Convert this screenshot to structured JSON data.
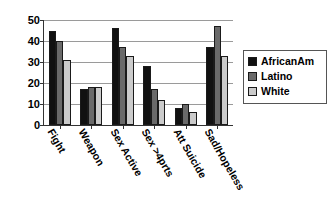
{
  "chart_data": {
    "type": "bar",
    "title": "",
    "subtitle": "",
    "xlabel": "",
    "ylabel": "",
    "ylim": [
      0,
      50
    ],
    "ytick_step": 10,
    "ytick_labels": [
      "50",
      "40",
      "30",
      "20",
      "10",
      "0"
    ],
    "ytick_values": [
      50,
      40,
      30,
      20,
      10,
      0
    ],
    "grid": true,
    "grid_axis": "y",
    "legend_position": "right",
    "categories": [
      "Fight",
      "Weapon",
      "Sex Active",
      "Sex >4prts",
      "Att Suicide",
      "Sad/Hopeless"
    ],
    "series": [
      {
        "name": "AfricanAm",
        "color": "#111111",
        "values": [
          45,
          17,
          46,
          28,
          8,
          37
        ]
      },
      {
        "name": "Latino",
        "color": "#6a6a6a",
        "values": [
          40,
          18,
          37,
          17,
          10,
          47
        ]
      },
      {
        "name": "White",
        "color": "#cbcbcb",
        "values": [
          31,
          18,
          33,
          12,
          6,
          33
        ]
      }
    ]
  },
  "legend": {
    "entries": [
      {
        "label": "AfricanAm",
        "swatch_name": "legend-swatch-africanam"
      },
      {
        "label": "Latino",
        "swatch_name": "legend-swatch-latino"
      },
      {
        "label": "White",
        "swatch_name": "legend-swatch-white"
      }
    ]
  },
  "colors": {
    "africanam": "#111111",
    "latino": "#6a6a6a",
    "white": "#cbcbcb",
    "axis": "#333333",
    "gridline": "#9a9a9a",
    "background": "#ffffff"
  }
}
